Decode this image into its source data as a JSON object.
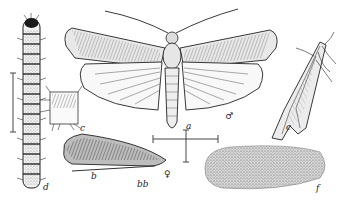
{
  "figure": {
    "labels": {
      "adult": "a",
      "male_symbol": "♂",
      "resting_moth": "c",
      "segment_detail": "c",
      "forewing": "b",
      "scale": "bb",
      "female_symbol": "♀",
      "larva": "d",
      "cocoon": "f"
    },
    "colors": {
      "ink": "#2a2a2a",
      "paper": "#ffffff",
      "shade": "#8a8a8a"
    }
  }
}
